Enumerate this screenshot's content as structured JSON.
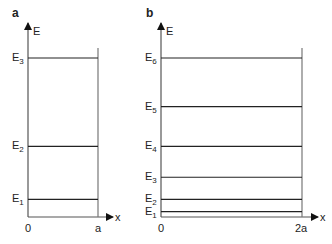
{
  "panels": [
    {
      "id": "a",
      "label": "a",
      "y_axis_label": "E",
      "x_axis_label": "x",
      "x_ticks": [
        "0",
        "a"
      ],
      "levels": [
        {
          "name": "E",
          "sub": "1",
          "n": 1
        },
        {
          "name": "E",
          "sub": "2",
          "n": 2
        },
        {
          "name": "E",
          "sub": "3",
          "n": 3
        }
      ]
    },
    {
      "id": "b",
      "label": "b",
      "y_axis_label": "E",
      "x_axis_label": "x",
      "x_ticks": [
        "0",
        "2a"
      ],
      "levels": [
        {
          "name": "E",
          "sub": "1",
          "n": 1
        },
        {
          "name": "E",
          "sub": "2",
          "n": 2
        },
        {
          "name": "E",
          "sub": "3",
          "n": 3
        },
        {
          "name": "E",
          "sub": "4",
          "n": 4
        },
        {
          "name": "E",
          "sub": "5",
          "n": 5
        },
        {
          "name": "E",
          "sub": "6",
          "n": 6
        }
      ]
    }
  ]
}
